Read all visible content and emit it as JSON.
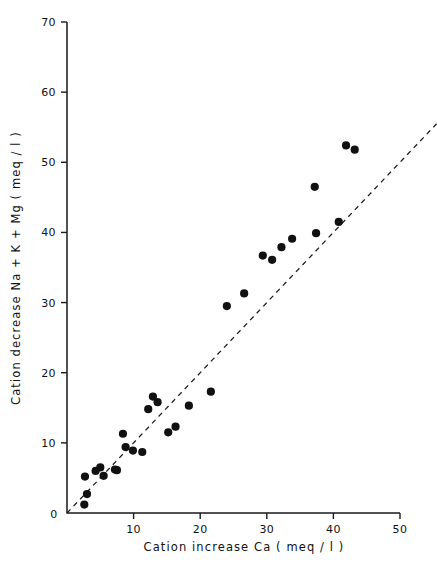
{
  "chart_data": {
    "type": "scatter",
    "title": "",
    "xlabel": "Cation  increase   Ca ( meq / l )",
    "ylabel": "Cation  decrease   Na + K + Mg  ( meq / l )",
    "xlim": [
      0,
      50
    ],
    "ylim": [
      0,
      70
    ],
    "xticks": [
      0,
      10,
      20,
      30,
      40,
      50
    ],
    "yticks": [
      0,
      10,
      20,
      30,
      40,
      50,
      60,
      70
    ],
    "xtick_labels": [
      "0",
      "10",
      "20",
      "30",
      "40",
      "50"
    ],
    "ytick_labels": [
      "0",
      "10",
      "20",
      "30",
      "40",
      "50",
      "60",
      "70"
    ],
    "grid": false,
    "legend": null,
    "series": [
      {
        "name": "Samples",
        "marker": "filled-circle",
        "marker_color": "#111111",
        "marker_size": 4.1,
        "points": [
          [
            2.6,
            1.2
          ],
          [
            2.7,
            5.2
          ],
          [
            3.0,
            2.7
          ],
          [
            4.3,
            6.0
          ],
          [
            5.0,
            6.5
          ],
          [
            5.5,
            5.3
          ],
          [
            7.2,
            6.2
          ],
          [
            7.5,
            6.1
          ],
          [
            8.4,
            11.3
          ],
          [
            8.8,
            9.4
          ],
          [
            9.9,
            8.9
          ],
          [
            11.3,
            8.7
          ],
          [
            12.2,
            14.8
          ],
          [
            12.9,
            16.6
          ],
          [
            13.6,
            15.8
          ],
          [
            15.2,
            11.5
          ],
          [
            16.3,
            12.3
          ],
          [
            18.3,
            15.3
          ],
          [
            21.6,
            17.3
          ],
          [
            24.0,
            29.5
          ],
          [
            26.6,
            31.3
          ],
          [
            29.4,
            36.7
          ],
          [
            30.8,
            36.1
          ],
          [
            32.2,
            37.9
          ],
          [
            33.8,
            39.1
          ],
          [
            37.2,
            46.5
          ],
          [
            37.4,
            39.9
          ],
          [
            40.8,
            41.5
          ],
          [
            41.9,
            52.4
          ],
          [
            43.2,
            51.8
          ]
        ]
      }
    ],
    "reference_line": {
      "name": "1:1 reference line",
      "style": "dashed",
      "color": "#1a1a1a",
      "x_start": 0.0,
      "y_start": 0.0,
      "x_end": 55.5,
      "y_end": 55.5
    }
  },
  "axis_geometry": {
    "x0_px": 67,
    "x_end_px": 400,
    "y0_px": 513,
    "y_end_px": 22,
    "plot_right_px": 437
  }
}
